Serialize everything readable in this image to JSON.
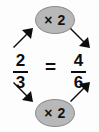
{
  "diagram": {
    "background_color": "#fdfdfd",
    "ink_color": "#0d0d0d",
    "oval_fill_color": "#b8b8b8",
    "oval_stroke_color": "#8e8e8e",
    "equals": "=",
    "operators": [
      {
        "id": "top",
        "label": "× 2",
        "position": "top-center"
      },
      {
        "id": "bottom",
        "label": "× 2",
        "position": "bottom-center"
      }
    ],
    "fractions": [
      {
        "id": "left",
        "numerator": "2",
        "denominator": "3",
        "spoken": "two thirds"
      },
      {
        "id": "right",
        "numerator": "4",
        "denominator": "6",
        "spoken": "four sixths"
      }
    ],
    "arrows": [
      {
        "id": "top-left",
        "direction": "northeast",
        "meaning": "from left numerator up to the top times-2 oval"
      },
      {
        "id": "top-right",
        "direction": "southeast",
        "meaning": "from the top times-2 oval down to the right numerator"
      },
      {
        "id": "bottom-left",
        "direction": "southeast",
        "meaning": "from left denominator down to the bottom times-2 oval"
      },
      {
        "id": "bottom-right",
        "direction": "northeast",
        "meaning": "from the bottom times-2 oval up to the right denominator"
      }
    ]
  }
}
